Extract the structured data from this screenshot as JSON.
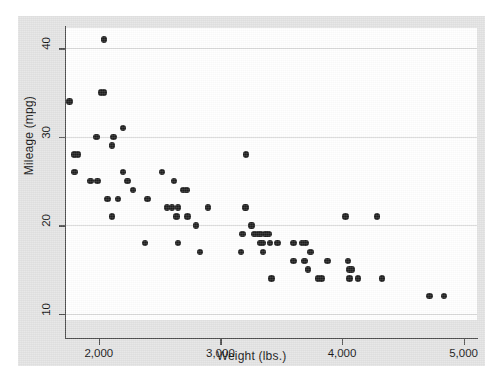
{
  "chart_data": {
    "type": "scatter",
    "title": "",
    "xlabel": "Weight (lbs.)",
    "ylabel": "Mileage (mpg)",
    "xlim": [
      1730,
      5110
    ],
    "ylim": [
      9.3,
      42.3
    ],
    "xticks": [
      2000,
      3000,
      4000,
      5000
    ],
    "xticklabels": [
      "2,000",
      "3,000",
      "4,000",
      "5,000"
    ],
    "yticks": [
      10,
      20,
      30,
      40
    ],
    "yticklabels": [
      "10",
      "20",
      "30",
      "40"
    ],
    "grid": "horizontal",
    "legend": "none",
    "marker": "filled-circle",
    "marker_color": "#1c1c1c",
    "background_color": "#e3e3e3",
    "plot_background_color": "#ffffff",
    "gridline_color": "#d8d8d8",
    "axis_color": "#4d4d4d",
    "n_points": 74,
    "points": [
      [
        1800,
        28
      ],
      [
        1830,
        28
      ],
      [
        1760,
        34
      ],
      [
        1800,
        26
      ],
      [
        1930,
        25
      ],
      [
        1990,
        25
      ],
      [
        1980,
        30
      ],
      [
        2020,
        35
      ],
      [
        2040,
        35
      ],
      [
        2040,
        41
      ],
      [
        2070,
        23
      ],
      [
        2120,
        30
      ],
      [
        2110,
        29
      ],
      [
        2110,
        21
      ],
      [
        2160,
        23
      ],
      [
        2200,
        31
      ],
      [
        2200,
        26
      ],
      [
        2230,
        25
      ],
      [
        2240,
        25
      ],
      [
        2280,
        24
      ],
      [
        2380,
        18
      ],
      [
        2400,
        23
      ],
      [
        2520,
        26
      ],
      [
        2560,
        22
      ],
      [
        2600,
        22
      ],
      [
        2620,
        25
      ],
      [
        2640,
        21
      ],
      [
        2650,
        18
      ],
      [
        2690,
        24
      ],
      [
        2720,
        24
      ],
      [
        2730,
        21
      ],
      [
        2800,
        20
      ],
      [
        2830,
        17
      ],
      [
        2900,
        22
      ],
      [
        3170,
        17
      ],
      [
        3180,
        19
      ],
      [
        3200,
        22
      ],
      [
        3210,
        22
      ],
      [
        3210,
        28
      ],
      [
        3250,
        20
      ],
      [
        3260,
        20
      ],
      [
        3280,
        19
      ],
      [
        3310,
        19
      ],
      [
        3330,
        18
      ],
      [
        3350,
        18
      ],
      [
        3350,
        17
      ],
      [
        3370,
        19
      ],
      [
        3380,
        19
      ],
      [
        3400,
        19
      ],
      [
        3410,
        18
      ],
      [
        3420,
        14
      ],
      [
        3470,
        18
      ],
      [
        3600,
        16
      ],
      [
        3600,
        18
      ],
      [
        3670,
        18
      ],
      [
        3690,
        16
      ],
      [
        3700,
        18
      ],
      [
        3720,
        15
      ],
      [
        3740,
        17
      ],
      [
        3800,
        14
      ],
      [
        3830,
        14
      ],
      [
        3880,
        16
      ],
      [
        4030,
        21
      ],
      [
        4050,
        16
      ],
      [
        4060,
        14
      ],
      [
        4060,
        15
      ],
      [
        4080,
        15
      ],
      [
        4130,
        14
      ],
      [
        4290,
        21
      ],
      [
        4330,
        14
      ],
      [
        4720,
        12
      ],
      [
        4840,
        12
      ],
      [
        2650,
        22
      ],
      [
        3330,
        19
      ]
    ]
  },
  "axes": {
    "x_ticks": [
      {
        "value": 2000,
        "label": "2,000"
      },
      {
        "value": 3000,
        "label": "3,000"
      },
      {
        "value": 4000,
        "label": "4,000"
      },
      {
        "value": 5000,
        "label": "5,000"
      }
    ],
    "y_ticks": [
      {
        "value": 40,
        "label": "40"
      },
      {
        "value": 30,
        "label": "30"
      },
      {
        "value": 20,
        "label": "20"
      },
      {
        "value": 10,
        "label": "10"
      }
    ],
    "x_title": "Weight (lbs.)",
    "y_title": "Mileage (mpg)"
  }
}
